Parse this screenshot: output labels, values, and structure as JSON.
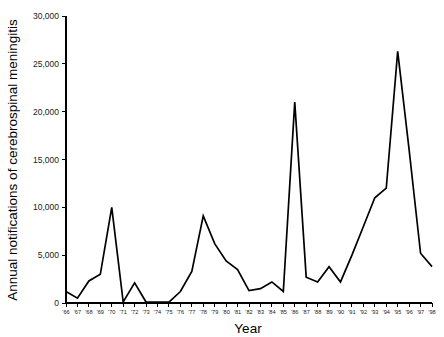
{
  "chart_data": {
    "type": "line",
    "title": "",
    "xlabel": "Year",
    "ylabel": "Annual notifications of cerebrospinal meningitis",
    "xlim": [
      1966,
      1998
    ],
    "ylim": [
      0,
      30000
    ],
    "grid": false,
    "legend": null,
    "y_ticks": [
      0,
      5000,
      10000,
      15000,
      20000,
      25000,
      30000
    ],
    "y_tick_labels": [
      "0",
      "5,000",
      "10,000",
      "15,000",
      "20,000",
      "25,000",
      "30,000"
    ],
    "categories": [
      "'66",
      "'67",
      "'68",
      "'69",
      "'70",
      "'71",
      "'72",
      "'73",
      "'74",
      "'75",
      "'76",
      "'77",
      "'78",
      "'79",
      "'80",
      "'81",
      "'82",
      "'83",
      "'84",
      "'85",
      "'86",
      "'87",
      "'88",
      "'89",
      "'90",
      "'91",
      "'92",
      "'93",
      "'94",
      "'95",
      "'96",
      "'97",
      "'98"
    ],
    "x": [
      1966,
      1967,
      1968,
      1969,
      1970,
      1971,
      1972,
      1973,
      1974,
      1975,
      1976,
      1977,
      1978,
      1979,
      1980,
      1981,
      1982,
      1983,
      1984,
      1985,
      1986,
      1987,
      1988,
      1989,
      1990,
      1991,
      1992,
      1993,
      1994,
      1995,
      1996,
      1997,
      1998
    ],
    "values": [
      1200,
      500,
      2300,
      3000,
      10000,
      100,
      2100,
      100,
      100,
      100,
      1200,
      3300,
      9100,
      6200,
      4400,
      3500,
      1300,
      1500,
      2200,
      1200,
      21000,
      2700,
      2200,
      3800,
      2200,
      5000,
      8000,
      11000,
      12000,
      26300,
      16000,
      5200,
      3800
    ]
  }
}
